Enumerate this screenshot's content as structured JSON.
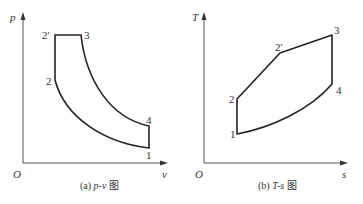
{
  "left_diagram": {
    "y_axis_label": "p",
    "x_axis_label": "v",
    "origin_label": "O",
    "points": {
      "p1": "1",
      "p2": "2",
      "p2prime": "2′",
      "p3": "3",
      "p4": "4"
    },
    "caption_prefix": "(a) ",
    "caption_var": "p-v",
    "caption_suffix": " 图"
  },
  "right_diagram": {
    "y_axis_label": "T",
    "x_axis_label": "s",
    "origin_label": "O",
    "points": {
      "p1": "1",
      "p2": "2",
      "p2prime": "2′",
      "p3": "3",
      "p4": "4"
    },
    "caption_prefix": "(b) ",
    "caption_var": "T-s",
    "caption_suffix": " 图"
  },
  "colors": {
    "line": "#222222",
    "text": "#333333"
  }
}
